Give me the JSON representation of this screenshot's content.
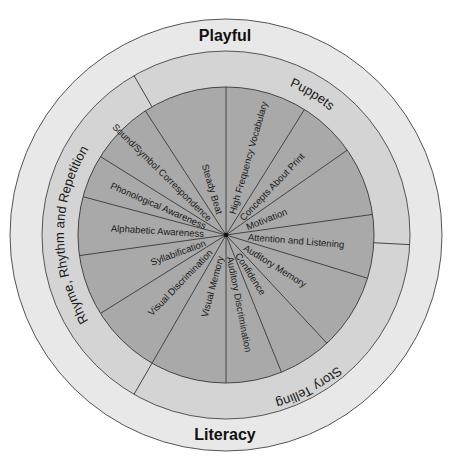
{
  "diagram": {
    "type": "concentric-wheel",
    "colors": {
      "background": "#ffffff",
      "outer_ring": "#e8e8e8",
      "middle_ring": "#d4d4d4",
      "inner_pie": "#a9a9a9",
      "lines": "#444444",
      "text": "#1a1a1a"
    },
    "outer_ring": {
      "top_label": "Playful",
      "bottom_label": "Literacy"
    },
    "middle_ring": {
      "segments": [
        {
          "label": "Puppets",
          "start_deg": -120,
          "end_deg": 3
        },
        {
          "label": "Story Telling",
          "start_deg": 3,
          "end_deg": 120
        },
        {
          "label": "Rhyme, Rhythm and Repetition",
          "start_deg": 120,
          "end_deg": 240
        }
      ]
    },
    "inner_pie": {
      "segments": [
        {
          "label": "High Frequency Vocabulary",
          "start_deg": -90,
          "end_deg": -58
        },
        {
          "label": "Concepts About Print",
          "start_deg": -58,
          "end_deg": -35
        },
        {
          "label": "Motivation",
          "start_deg": -35,
          "end_deg": -8
        },
        {
          "label": "Attention and Listening",
          "start_deg": -8,
          "end_deg": 17
        },
        {
          "label": "Auditory Memory",
          "start_deg": 17,
          "end_deg": 47
        },
        {
          "label": "Confidence",
          "start_deg": 47,
          "end_deg": 68
        },
        {
          "label": "Auditory Discrimination",
          "start_deg": 68,
          "end_deg": 90
        },
        {
          "label": "Visual Memory",
          "start_deg": 90,
          "end_deg": 120
        },
        {
          "label": "Visual Discrimination",
          "start_deg": 120,
          "end_deg": 148
        },
        {
          "label": "Syllabification",
          "start_deg": 148,
          "end_deg": 172
        },
        {
          "label": "Alphabetic Awareness",
          "start_deg": 172,
          "end_deg": 195
        },
        {
          "label": "Phonological Awareness",
          "start_deg": 195,
          "end_deg": 212
        },
        {
          "label": "Sound/Symbol Correspondence",
          "start_deg": 212,
          "end_deg": 237
        },
        {
          "label": "Steady Beat",
          "start_deg": 237,
          "end_deg": 270
        }
      ]
    }
  }
}
